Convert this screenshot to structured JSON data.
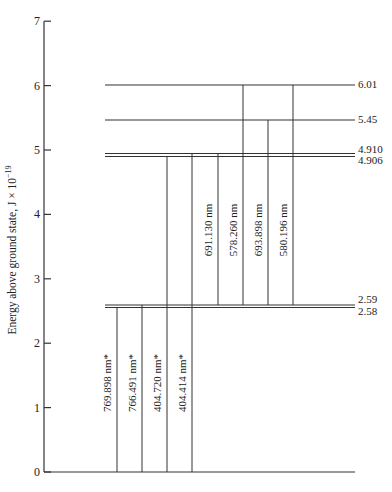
{
  "diagram": {
    "y_axis_label": "Energy above ground state, J × 10",
    "y_axis_exponent": "−19",
    "y_ticks": [
      "0",
      "1",
      "2",
      "3",
      "4",
      "5",
      "6",
      "7"
    ],
    "levels": [
      {
        "value": 6.01,
        "label": "6.01"
      },
      {
        "value": 5.45,
        "label": "5.45"
      },
      {
        "value": 4.91,
        "label": "4.910"
      },
      {
        "value": 4.906,
        "label": "4.906"
      },
      {
        "value": 2.59,
        "label": "2.59"
      },
      {
        "value": 2.58,
        "label": "2.58"
      }
    ],
    "transitions": [
      {
        "label": "769.898 nm*",
        "from": 2.58,
        "to": 0
      },
      {
        "label": "766.491 nm*",
        "from": 2.59,
        "to": 0
      },
      {
        "label": "404.720 nm*",
        "from": 4.906,
        "to": 0
      },
      {
        "label": "404.414 nm*",
        "from": 4.91,
        "to": 0
      },
      {
        "label": "691.130 nm",
        "from": 4.91,
        "to": 2.59
      },
      {
        "label": "578.260 nm",
        "from": 5.45,
        "to": 2.59
      },
      {
        "label": "693.898 nm",
        "from": 6.01,
        "to": 2.59
      },
      {
        "label": "580.196 nm",
        "from": 5.45,
        "to": 2.58
      },
      {
        "label": "580.196 nm",
        "from": 6.01,
        "to": 2.58
      }
    ]
  }
}
